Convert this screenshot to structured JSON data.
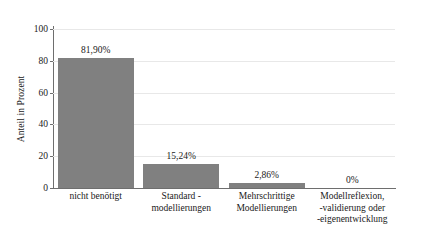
{
  "chart_data": {
    "type": "bar",
    "title": "",
    "subtitle": "",
    "xlabel": "",
    "ylabel": "Anteil in Prozent",
    "ylim": [
      0,
      100
    ],
    "yticks": [
      0,
      20,
      40,
      60,
      80,
      100
    ],
    "ytick_labels": [
      "0",
      "20",
      "40",
      "60",
      "80",
      "100"
    ],
    "grid": true,
    "grid_axis": "y",
    "legend": false,
    "legend_position": "none",
    "bar_color": "#808080",
    "axis_color": "#6e6e6e",
    "gridline_color": "#e8e8e8",
    "categories": [
      "nicht benötigt",
      "Standard -\nmodellierungen",
      "Mehrschrittige\nModellierungen",
      "Modellreflexion,\n-validierung oder\n-eigenentwicklung"
    ],
    "category_lines": [
      [
        "nicht benötigt"
      ],
      [
        "Standard -",
        "modellierungen"
      ],
      [
        "Mehrschrittige",
        "Modellierungen"
      ],
      [
        "Modellreflexion,",
        "-validierung oder",
        "-eigenentwicklung"
      ]
    ],
    "values": [
      81.9,
      15.24,
      2.86,
      0
    ],
    "data_labels": [
      "81,90%",
      "15,24%",
      "2,86%",
      "0%"
    ]
  }
}
